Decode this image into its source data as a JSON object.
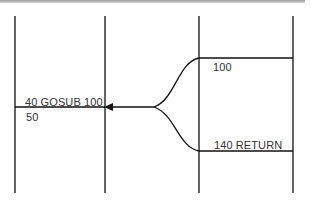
{
  "diagram": {
    "type": "gosub-return-flow",
    "colors": {
      "line": "#111111",
      "text": "#333333",
      "background": "#ffffff"
    },
    "labels": {
      "gosub_line": "40 GOSUB 100",
      "next_line": "50",
      "subroutine_start": "100",
      "return_line": "140 RETURN"
    },
    "icons": {
      "arrowhead": "arrow-left-icon"
    }
  }
}
